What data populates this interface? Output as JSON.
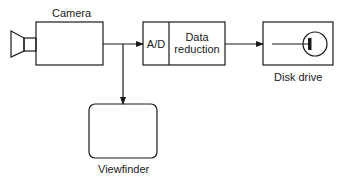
{
  "diagram": {
    "nodes": {
      "camera": {
        "label": "Camera"
      },
      "ad": {
        "label": "A/D"
      },
      "data_reduction": {
        "label_line1": "Data",
        "label_line2": "reduction"
      },
      "disk_drive": {
        "label": "Disk drive"
      },
      "viewfinder": {
        "label": "Viewfinder"
      }
    },
    "edges": [
      {
        "from": "camera",
        "to": "ad"
      },
      {
        "from": "camera",
        "to": "viewfinder"
      },
      {
        "from": "data_reduction",
        "to": "disk_drive"
      }
    ],
    "colors": {
      "stroke": "#1a1a1a",
      "background": "#ffffff"
    }
  }
}
